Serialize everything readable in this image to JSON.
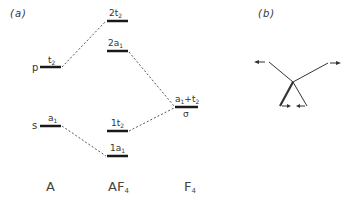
{
  "panels": {
    "a_label": "(a)",
    "b_label": "(b)"
  },
  "diagram_a": {
    "columns": {
      "atom": "A",
      "molecule_main": "AF",
      "molecule_sub": "4",
      "ligand_main": "F",
      "ligand_sub": "4"
    },
    "atom_levels": [
      {
        "orbital": "p",
        "sym_main": "t",
        "sym_sub": "2"
      },
      {
        "orbital": "s",
        "sym_main": "a",
        "sym_sub": "1"
      }
    ],
    "molecular_levels": [
      {
        "main": "2t",
        "sub": "2"
      },
      {
        "main": "2a",
        "sub": "1"
      },
      {
        "main": "1t",
        "sub": "2"
      },
      {
        "main": "1a",
        "sub": "1"
      }
    ],
    "ligand_level": {
      "sym_a": "a",
      "sym_a_sub": "1",
      "plus": "+",
      "sym_t": "t",
      "sym_t_sub": "2",
      "sigma": "σ"
    }
  },
  "colors": {
    "line": "#1a1a1a",
    "dashed": "#555555",
    "text": "#333333"
  }
}
